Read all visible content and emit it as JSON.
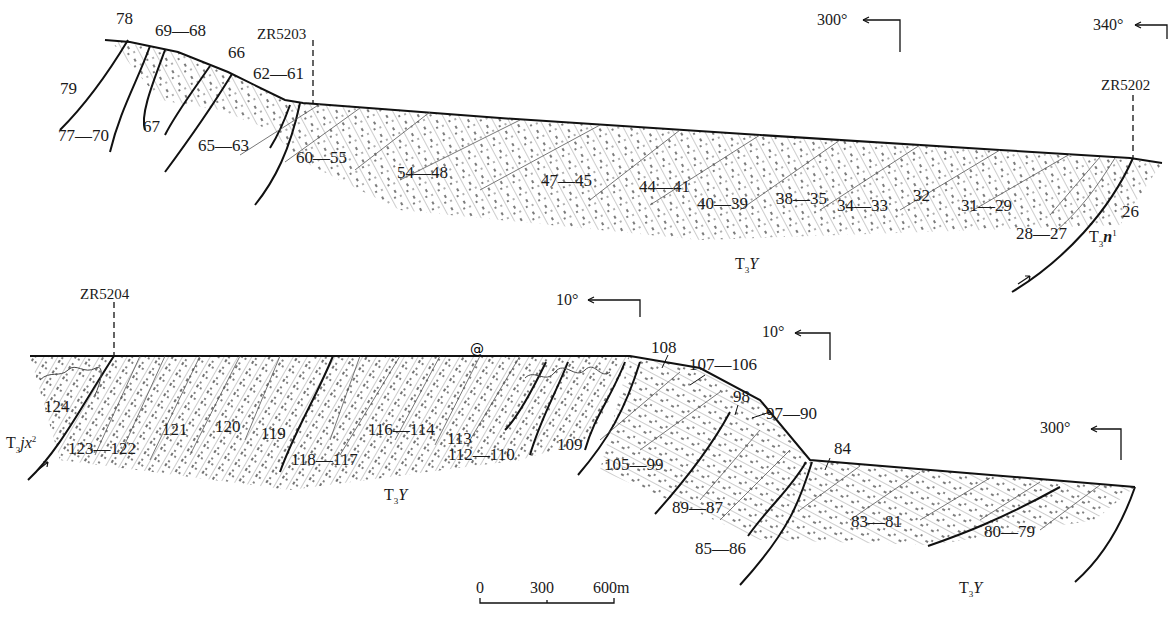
{
  "diagram": {
    "type": "geological-cross-section",
    "sections": [
      {
        "id": "upper-section",
        "wells": [
          {
            "label": "ZR5203"
          },
          {
            "label": "ZR5202"
          }
        ],
        "orientations": [
          {
            "label": "300°"
          },
          {
            "label": "340°"
          }
        ],
        "units": [
          {
            "prefix": "T",
            "sub": "3",
            "italic": "Y",
            "sup": ""
          },
          {
            "prefix": "T",
            "sub": "3",
            "italic": "n",
            "sup": "1"
          }
        ],
        "bed_labels": [
          "78",
          "69—68",
          "66",
          "62—61",
          "79",
          "77—70",
          "67",
          "65—63",
          "60—55",
          "54—48",
          "47—45",
          "44—41",
          "40—39",
          "38—35",
          "34—33",
          "32",
          "31—29",
          "28—27",
          "26"
        ]
      },
      {
        "id": "lower-section",
        "wells": [
          {
            "label": "ZR5204"
          }
        ],
        "orientations": [
          {
            "label": "10°"
          },
          {
            "label": "10°"
          },
          {
            "label": "300°"
          }
        ],
        "units": [
          {
            "prefix": "T",
            "sub": "3",
            "italic": "jx",
            "sup": "2"
          },
          {
            "prefix": "T",
            "sub": "3",
            "italic": "Y",
            "sup": ""
          },
          {
            "prefix": "T",
            "sub": "3",
            "italic": "Y",
            "sup": ""
          }
        ],
        "bed_labels": [
          "124",
          "123—122",
          "121",
          "120",
          "119",
          "118—117",
          "116—114",
          "113",
          "112—110",
          "109",
          "108",
          "107—106",
          "105—99",
          "98",
          "97—90",
          "89—87",
          "85—86",
          "84",
          "83—81",
          "80—79"
        ]
      }
    ],
    "scale_bar": {
      "ticks": [
        "0",
        "300",
        "600m"
      ]
    }
  }
}
